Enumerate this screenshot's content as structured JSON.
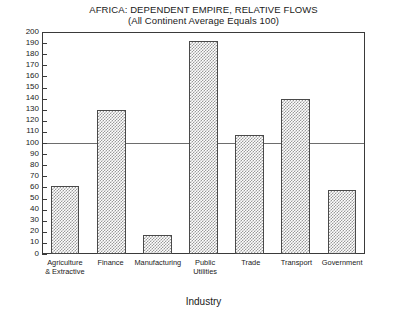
{
  "chart_data": {
    "type": "bar",
    "title": "AFRICA: DEPENDENT EMPIRE, RELATIVE FLOWS",
    "subtitle": "(All Continent Average Equals 100)",
    "xlabel": "Industry",
    "ylabel": "",
    "ylim": [
      0,
      200
    ],
    "ytick_step": 10,
    "grid": false,
    "legend": "none",
    "reference_line": 100,
    "categories": [
      "Agriculture & Extractive",
      "Finance",
      "Manufacturing",
      "Public Utilities",
      "Trade",
      "Transport",
      "Government"
    ],
    "category_lines": [
      [
        "Agriculture",
        "& Extractive"
      ],
      [
        "Finance",
        ""
      ],
      [
        "Manufacturing",
        ""
      ],
      [
        "Public",
        "Utilities"
      ],
      [
        "Trade",
        ""
      ],
      [
        "Transport",
        ""
      ],
      [
        "Government",
        ""
      ]
    ],
    "values": [
      61,
      130,
      17,
      192,
      107,
      140,
      58
    ],
    "ytick_labels": [
      "200",
      "190",
      "180",
      "170",
      "160",
      "150",
      "140",
      "130",
      "120",
      "110",
      "100",
      "90",
      "80",
      "70",
      "60",
      "50",
      "40",
      "30",
      "20",
      "10",
      "0"
    ],
    "colors": {
      "bar_fill": "#9a9a9a",
      "bar_edge": "#4a4a4a",
      "axis": "#3a3a3a",
      "reference_line": "#6d6d6d",
      "text": "#1a1a1a",
      "background": "#ffffff"
    }
  }
}
